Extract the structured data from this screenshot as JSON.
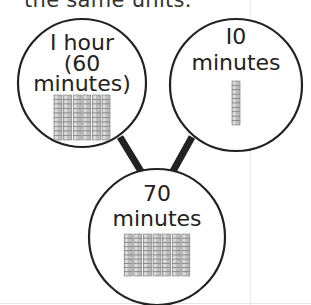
{
  "header_text": "the same units.",
  "nodes": [
    {
      "id": "one-hour",
      "lines": [
        "I hour",
        "(60",
        "minutes)"
      ],
      "rods": 6,
      "cubes_per_rod": 10
    },
    {
      "id": "ten-minutes",
      "lines": [
        "I0",
        "minutes"
      ],
      "rods": 1,
      "cubes_per_rod": 10
    },
    {
      "id": "seventy-minutes",
      "lines": [
        "70",
        "minutes"
      ],
      "rods": 7,
      "cubes_per_rod": 10
    }
  ],
  "edges": [
    {
      "from": "one-hour",
      "to": "seventy-minutes"
    },
    {
      "from": "ten-minutes",
      "to": "seventy-minutes"
    }
  ],
  "colors": {
    "stroke": "#222222",
    "cube_fill": "#bdbdbd",
    "cube_edge": "#7a7a7a"
  }
}
